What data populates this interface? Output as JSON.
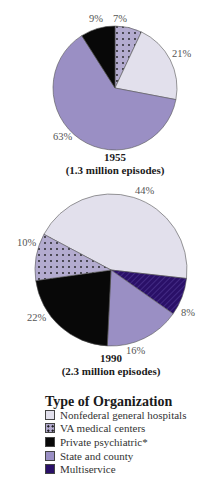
{
  "chart_data": [
    {
      "type": "pie",
      "title": "1955",
      "subtitle": "(1.3 million episodes)",
      "categories": [
        "VA medical centers",
        "Nonfederal general hospitals",
        "State and county",
        "Private psychiatric*"
      ],
      "values": [
        7,
        21,
        63,
        9
      ],
      "labels": [
        "7%",
        "21%",
        "63%",
        "9%"
      ]
    },
    {
      "type": "pie",
      "title": "1990",
      "subtitle": "(2.3 million episodes)",
      "categories": [
        "Nonfederal general hospitals",
        "Multiservice",
        "State and county",
        "Private psychiatric*",
        "VA medical centers"
      ],
      "values": [
        44,
        8,
        16,
        22,
        10
      ],
      "labels": [
        "44%",
        "8%",
        "16%",
        "22%",
        "10%"
      ]
    }
  ],
  "legend": {
    "title": "Type of Organization",
    "items": [
      {
        "label": "Nonfederal general hospitals",
        "color": "#e2e0ec",
        "pattern": "none"
      },
      {
        "label": "VA medical centers",
        "color": "#b3abcf",
        "pattern": "dots"
      },
      {
        "label": "Private psychiatric*",
        "color": "#080808",
        "pattern": "none"
      },
      {
        "label": "State and county",
        "color": "#9a8fc4",
        "pattern": "none"
      },
      {
        "label": "Multiservice",
        "color": "#2a1068",
        "pattern": "stripes"
      }
    ]
  },
  "pie1": {
    "year": "1955",
    "episodes": "(1.3 million episodes)",
    "labels": [
      "7%",
      "21%",
      "63%",
      "9%"
    ]
  },
  "pie2": {
    "year": "1990",
    "episodes": "(2.3 million episodes)",
    "labels": [
      "44%",
      "8%",
      "16%",
      "22%",
      "10%"
    ]
  }
}
